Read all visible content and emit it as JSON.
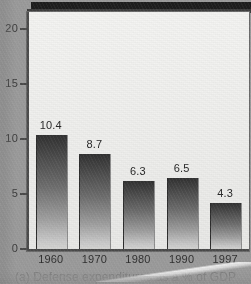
{
  "figure": {
    "caption": "(a) Defense expenditures as a % of GDP",
    "background_color": "#9b9b9b",
    "panel_color": "#f2f2f0",
    "axis_color": "#4b4b4b",
    "bar_color_top": "#313131",
    "bar_color_bottom": "#d6d6d4"
  },
  "chart_data": {
    "type": "bar",
    "title": "",
    "subtitle": "",
    "xlabel": "",
    "ylabel": "",
    "categories": [
      "1960",
      "1970",
      "1980",
      "1990",
      "1997"
    ],
    "values": [
      10.4,
      8.7,
      6.3,
      6.5,
      4.3
    ],
    "data_labels": [
      "10.4",
      "8.7",
      "6.3",
      "6.5",
      "4.3"
    ],
    "ylim": [
      0,
      21.5
    ],
    "yticks": [
      0,
      5,
      10,
      15,
      20
    ],
    "ytick_labels": [
      "0",
      "5",
      "10",
      "15",
      "20"
    ],
    "grid": false,
    "legend": false,
    "legend_position": "none",
    "annotations": [
      "(a) Defense expenditures as a % of GDP"
    ]
  }
}
